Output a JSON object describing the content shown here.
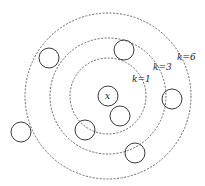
{
  "diagram": {
    "center": {
      "label": "x",
      "cx": 108,
      "cy": 96,
      "r": 10
    },
    "rings": [
      {
        "label": "k=1",
        "r": 38,
        "label_x": 132,
        "label_y": 82
      },
      {
        "label": "k=3",
        "r": 58,
        "label_x": 153,
        "label_y": 70
      },
      {
        "label": "k=6",
        "r": 83,
        "label_x": 177,
        "label_y": 60
      }
    ],
    "points": [
      {
        "cx": 124,
        "cy": 50
      },
      {
        "cx": 49,
        "cy": 58
      },
      {
        "cx": 172,
        "cy": 99
      },
      {
        "cx": 120,
        "cy": 116
      },
      {
        "cx": 85,
        "cy": 130
      },
      {
        "cx": 21,
        "cy": 132
      },
      {
        "cx": 135,
        "cy": 153
      }
    ],
    "point_radius": 10
  }
}
